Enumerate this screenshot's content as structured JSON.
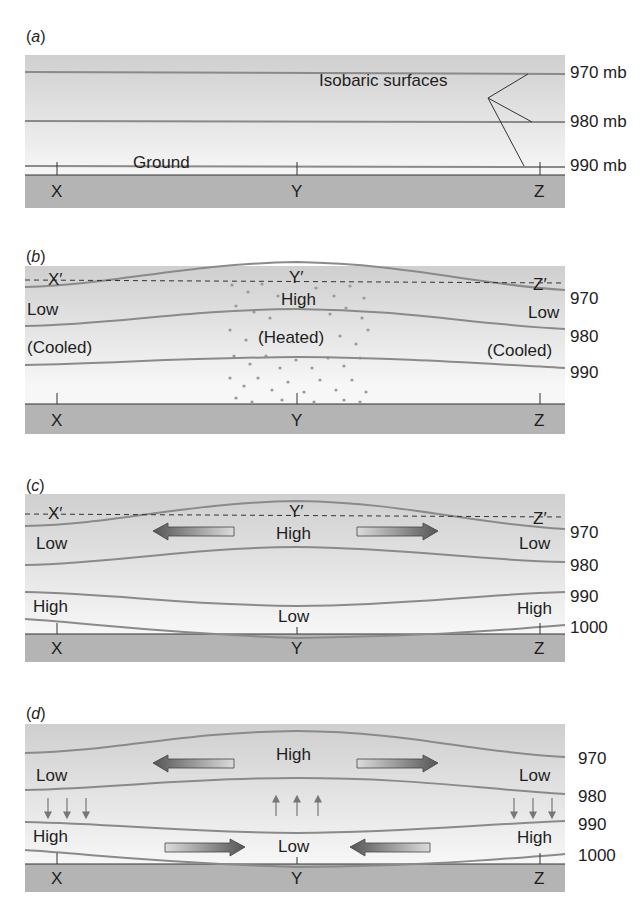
{
  "figure": {
    "panels": [
      {
        "id": "a",
        "label": "(a)",
        "annotation": "Isobaric surfaces",
        "ground_label": "Ground",
        "points": [
          "X",
          "Y",
          "Z"
        ],
        "isobars": [
          "970 mb",
          "980 mb",
          "990 mb"
        ]
      },
      {
        "id": "b",
        "label": "(b)",
        "ref_points": [
          "X′",
          "Y′",
          "Z′"
        ],
        "points": [
          "X",
          "Y",
          "Z"
        ],
        "isobars": [
          "970",
          "980",
          "990"
        ],
        "left_pressure": "Low",
        "center_pressure": "High",
        "right_pressure": "Low",
        "left_state": "(Cooled)",
        "center_state": "(Heated)",
        "right_state": "(Cooled)"
      },
      {
        "id": "c",
        "label": "(c)",
        "ref_points": [
          "X′",
          "Y′",
          "Z′"
        ],
        "points": [
          "X",
          "Y",
          "Z"
        ],
        "isobars": [
          "970",
          "980",
          "990",
          "1000"
        ],
        "upper": {
          "left": "Low",
          "center": "High",
          "right": "Low"
        },
        "surface": {
          "left": "High",
          "center": "Low",
          "right": "High"
        }
      },
      {
        "id": "d",
        "label": "(d)",
        "points": [
          "X",
          "Y",
          "Z"
        ],
        "isobars": [
          "970",
          "980",
          "990",
          "1000"
        ],
        "upper": {
          "left": "Low",
          "center": "High",
          "right": "Low"
        },
        "surface": {
          "left": "High",
          "center": "Low",
          "right": "High"
        },
        "vertical_motion": {
          "left": "down",
          "center": "up",
          "right": "down"
        }
      }
    ],
    "colors": {
      "band": "#d0d0d0",
      "ground": "#b4b4b4",
      "isobar": "#8a8a8a",
      "arrow_dark": "#5e5e5e",
      "arrow_light": "#d8d8d8"
    }
  }
}
